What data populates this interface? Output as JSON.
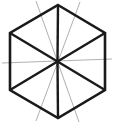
{
  "canvas": {
    "width": 113,
    "height": 123,
    "background": "#ffffff",
    "title": "hexagon-with-diagonals-line-drawing"
  },
  "style": {
    "edge_color": "#1a1a1a",
    "edge_width": 2.6,
    "spoke_color": "#1a1a1a",
    "spoke_width": 2.4,
    "guide_color": "#9a9a9a",
    "guide_width": 0.8
  },
  "geometry": {
    "center": {
      "x": 57.5,
      "y": 61.5
    },
    "vertices": [
      {
        "name": "top",
        "x": 58,
        "y": 5
      },
      {
        "name": "upper-right",
        "x": 105,
        "y": 33
      },
      {
        "name": "lower-right",
        "x": 105,
        "y": 90
      },
      {
        "name": "bottom",
        "x": 58,
        "y": 118
      },
      {
        "name": "lower-left",
        "x": 10,
        "y": 90
      },
      {
        "name": "upper-left",
        "x": 10,
        "y": 33
      }
    ],
    "hexagon_path": "M 58 5 L 105 33 L 105 90 L 58 118 L 10 90 L 10 33 Z",
    "spokes": [
      {
        "name": "spoke-top",
        "x1": 57.5,
        "y1": 61.5,
        "x2": 58,
        "y2": 5
      },
      {
        "name": "spoke-upper-right",
        "x1": 57.5,
        "y1": 61.5,
        "x2": 105,
        "y2": 33
      },
      {
        "name": "spoke-lower-right",
        "x1": 57.5,
        "y1": 61.5,
        "x2": 105,
        "y2": 90
      },
      {
        "name": "spoke-bottom",
        "x1": 57.5,
        "y1": 61.5,
        "x2": 58,
        "y2": 118
      },
      {
        "name": "spoke-lower-left",
        "x1": 57.5,
        "y1": 61.5,
        "x2": 10,
        "y2": 90
      },
      {
        "name": "spoke-upper-left",
        "x1": 57.5,
        "y1": 61.5,
        "x2": 10,
        "y2": 33
      }
    ],
    "guides": [
      {
        "name": "guide-horizontal",
        "x1": 2,
        "y1": 63,
        "x2": 112,
        "y2": 59
      },
      {
        "name": "guide-diagonal-left",
        "x1": 36,
        "y1": 1,
        "x2": 79,
        "y2": 122
      },
      {
        "name": "guide-diagonal-right",
        "x1": 80,
        "y1": 2,
        "x2": 36,
        "y2": 121
      }
    ]
  }
}
